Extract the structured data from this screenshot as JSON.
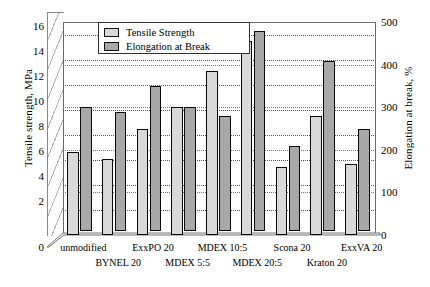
{
  "chart_data": {
    "type": "bar",
    "title": "",
    "categories": [
      "unmodified",
      "BYNEL 20",
      "ExxPO 20",
      "MDEX 5:5",
      "MDEX 10:5",
      "MDEX 20:5",
      "Scona 20",
      "Kraton 20",
      "ExxVA 20"
    ],
    "series": [
      {
        "name": "Tensile Strength",
        "axis": "left",
        "unit": "MPa",
        "color": "#d9d9d9",
        "values": [
          6.6,
          6.1,
          8.5,
          10.2,
          13.1,
          15.5,
          5.4,
          9.5,
          5.7
        ]
      },
      {
        "name": "Elongation at Break",
        "axis": "right",
        "unit": "%",
        "color": "#a8a8a8",
        "values": [
          290,
          280,
          340,
          290,
          270,
          470,
          200,
          400,
          240
        ]
      }
    ],
    "xlabel": "",
    "ylabel": "Tensile strength, MPa",
    "ylabel_right": "Elongation at break, %",
    "ylim": [
      0,
      17
    ],
    "ylim_right": [
      0,
      500
    ],
    "yticks": [
      2,
      4,
      6,
      8,
      10,
      12,
      14,
      16
    ],
    "yticks_right": [
      0,
      100,
      200,
      300,
      400,
      500
    ],
    "grid": true,
    "legend_position": "top-center",
    "style": "3d-perspective-clustered-column"
  },
  "axes": {
    "left_title": "Tensile strength, MPa",
    "right_title": "Elongation at break, %",
    "left_ticks": [
      "16",
      "14",
      "12",
      "10",
      "8",
      "6",
      "4",
      "2",
      "0"
    ],
    "right_ticks": [
      "500",
      "400",
      "300",
      "200",
      "100",
      "0"
    ]
  },
  "legend": {
    "items": [
      {
        "label": "Tensile Strength",
        "swatch": "tensile-swatch"
      },
      {
        "label": "Elongation at Break",
        "swatch": "elongation-swatch"
      }
    ]
  },
  "categories": [
    {
      "label": "unmodified",
      "row": 0
    },
    {
      "label": "BYNEL 20",
      "row": 1
    },
    {
      "label": "ExxPO 20",
      "row": 0
    },
    {
      "label": "MDEX 5:5",
      "row": 1
    },
    {
      "label": "MDEX 10:5",
      "row": 0
    },
    {
      "label": "MDEX 20:5",
      "row": 1
    },
    {
      "label": "Scona 20",
      "row": 0
    },
    {
      "label": "Kraton 20",
      "row": 1
    },
    {
      "label": "ExxVA 20",
      "row": 0
    }
  ]
}
